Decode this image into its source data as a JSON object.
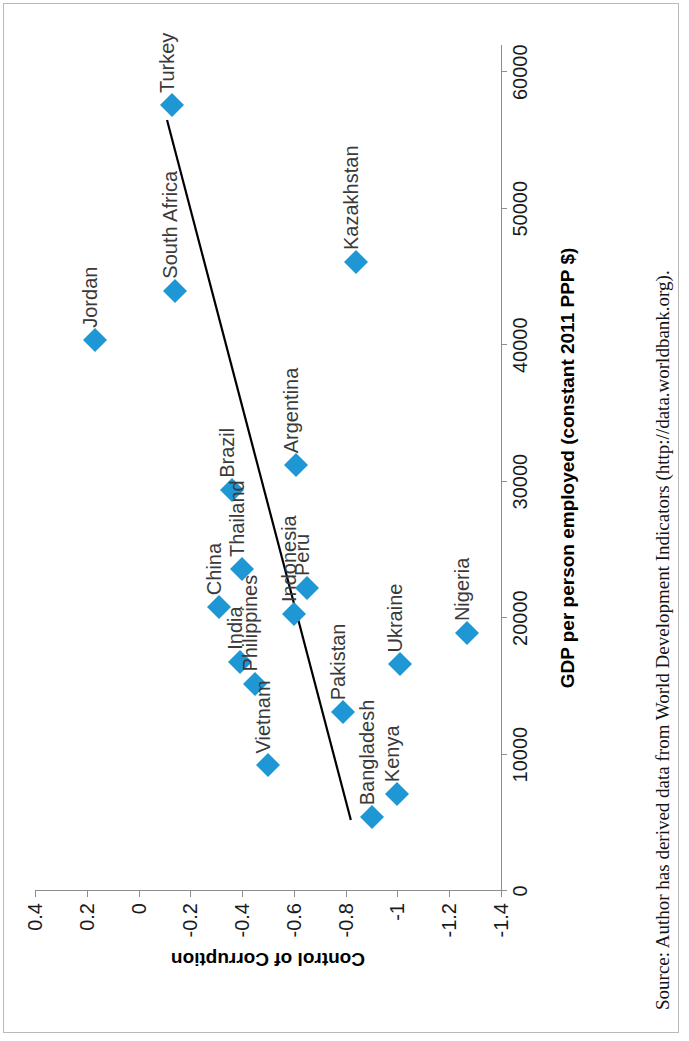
{
  "figure": {
    "rotation_degrees": -90,
    "background_color": "#ffffff",
    "marker_color": "#1f97d4",
    "trendline_color": "#000000",
    "axis_color": "#8d8d8d"
  },
  "source_note": "Source: Author has derived data from World Development Indicators (http://data.worldbank.org).",
  "chart_data": {
    "type": "scatter",
    "title": "",
    "xlabel": "GDP per person employed (constant 2011 PPP $)",
    "ylabel": "Control of Corruption",
    "xlim": [
      0,
      62000
    ],
    "ylim": [
      -1.4,
      0.4
    ],
    "xticks": [
      0,
      10000,
      20000,
      30000,
      40000,
      50000,
      60000
    ],
    "xticklabels": [
      "0",
      "10000",
      "20000",
      "30000",
      "40000",
      "50000",
      "60000"
    ],
    "yticks": [
      0.4,
      0.2,
      0,
      -0.2,
      -0.4,
      -0.6,
      -0.8,
      -1,
      -1.2,
      -1.4
    ],
    "yticklabels": [
      "0.4",
      "0.2",
      "0",
      "-0.2",
      "-0.4",
      "-0.6",
      "-0.8",
      "-1",
      "-1.2",
      "-1.4"
    ],
    "grid": false,
    "legend": false,
    "points": [
      {
        "label": "Turkey",
        "x": 57600,
        "y": -0.13
      },
      {
        "label": "South Africa",
        "x": 44000,
        "y": -0.14
      },
      {
        "label": "Jordan",
        "x": 40400,
        "y": 0.17
      },
      {
        "label": "Kazakhstan",
        "x": 46100,
        "y": -0.84
      },
      {
        "label": "Brazil",
        "x": 29400,
        "y": -0.36
      },
      {
        "label": "Argentina",
        "x": 31200,
        "y": -0.61
      },
      {
        "label": "China",
        "x": 20800,
        "y": -0.31
      },
      {
        "label": "Thailand",
        "x": 23600,
        "y": -0.4
      },
      {
        "label": "Indonesia",
        "x": 20300,
        "y": -0.6
      },
      {
        "label": "Peru",
        "x": 22200,
        "y": -0.65
      },
      {
        "label": "India",
        "x": 16800,
        "y": -0.39
      },
      {
        "label": "Philippines",
        "x": 15200,
        "y": -0.45
      },
      {
        "label": "Vietnam",
        "x": 9200,
        "y": -0.5
      },
      {
        "label": "Pakistan",
        "x": 13100,
        "y": -0.79
      },
      {
        "label": "Ukraine",
        "x": 16600,
        "y": -1.01
      },
      {
        "label": "Nigeria",
        "x": 18900,
        "y": -1.27
      },
      {
        "label": "Bangladesh",
        "x": 5400,
        "y": -0.9
      },
      {
        "label": "Kenya",
        "x": 7100,
        "y": -1.0
      }
    ],
    "trendline": {
      "x0": 5200,
      "y0": -0.82,
      "x1": 56500,
      "y1": -0.11
    }
  }
}
